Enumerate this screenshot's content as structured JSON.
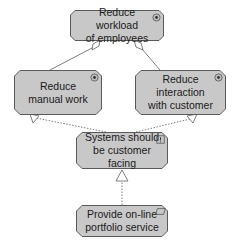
{
  "colors": {
    "node_fill": "#c8c8c8",
    "node_stroke": "#5a5a5a",
    "edge": "#707070"
  },
  "nodes": [
    {
      "id": "reduce-workload",
      "label": "Reduce workload\nof employees",
      "type": "goal",
      "icon": "goal-icon"
    },
    {
      "id": "reduce-manual-work",
      "label": "Reduce\nmanual work",
      "type": "goal",
      "icon": "goal-icon"
    },
    {
      "id": "reduce-interaction",
      "label": "Reduce interaction\nwith customer",
      "type": "goal",
      "icon": "goal-icon"
    },
    {
      "id": "customer-facing",
      "label": "Systems should\nbe customer facing",
      "type": "principle",
      "icon": "principle-icon"
    },
    {
      "id": "online-portfolio",
      "label": "Provide on-line\nportfolio service",
      "type": "requirement",
      "icon": "requirement-icon"
    }
  ],
  "edges": [
    {
      "from": "reduce-manual-work",
      "to": "reduce-workload",
      "type": "aggregation"
    },
    {
      "from": "reduce-interaction",
      "to": "reduce-workload",
      "type": "aggregation"
    },
    {
      "from": "customer-facing",
      "to": "reduce-manual-work",
      "type": "realization"
    },
    {
      "from": "customer-facing",
      "to": "reduce-interaction",
      "type": "realization"
    },
    {
      "from": "online-portfolio",
      "to": "customer-facing",
      "type": "realization"
    }
  ]
}
